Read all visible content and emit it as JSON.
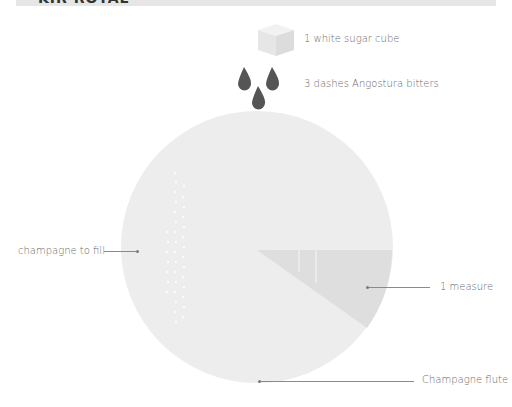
{
  "header": {
    "title": "KIR ROYAL"
  },
  "ingredients": [
    {
      "icon": "sugar-cube-icon",
      "label": "1 white sugar cube"
    },
    {
      "icon": "bitters-drops-icon",
      "label": "3 dashes Angostura bitters"
    }
  ],
  "glass": {
    "labels": {
      "champagne": "champagne to fill",
      "measure": "1 measure",
      "glass": "Champagne flute"
    },
    "colors": {
      "glass_fill": "#ececec",
      "measure_fill": "#dedede",
      "bubble": "#ffffff",
      "drop": "#555555",
      "cube": "#e8e8e8"
    }
  }
}
